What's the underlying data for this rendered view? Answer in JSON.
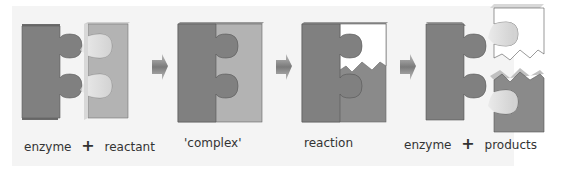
{
  "diagram": {
    "type": "process-flow",
    "colors": {
      "background": "#f4f4f4",
      "enzyme": "#7f7f7f",
      "reactant": "#b3b3b3",
      "product_upper": "#ffffff",
      "product_lower": "#8a8a8a",
      "arrow": "#8c8c8c"
    },
    "stages": [
      {
        "id": "stage-1",
        "label_left": "enzyme",
        "operator": "+",
        "label_right": "reactant"
      },
      {
        "id": "stage-2",
        "label": "'complex'"
      },
      {
        "id": "stage-3",
        "label": "reaction"
      },
      {
        "id": "stage-4",
        "label_left": "enzyme",
        "operator": "+",
        "label_right": "products"
      }
    ],
    "arrows": [
      {
        "from": "stage-1",
        "to": "stage-2",
        "icon": "right-arrow-icon"
      },
      {
        "from": "stage-2",
        "to": "stage-3",
        "icon": "right-arrow-icon"
      },
      {
        "from": "stage-3",
        "to": "stage-4",
        "icon": "right-arrow-icon"
      }
    ]
  }
}
